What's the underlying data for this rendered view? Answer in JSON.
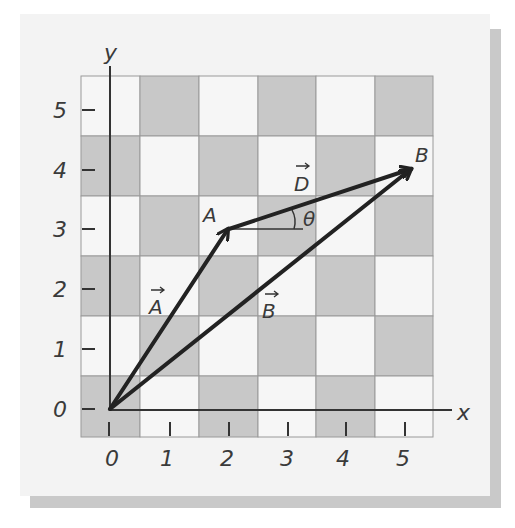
{
  "diagram": {
    "title": "",
    "axes": {
      "x_label": "x",
      "y_label": "y",
      "x_ticks": [
        "0",
        "1",
        "2",
        "3",
        "4",
        "5"
      ],
      "y_ticks": [
        "0",
        "1",
        "2",
        "3",
        "4",
        "5"
      ]
    },
    "points": {
      "A": {
        "label": "A",
        "x": 2,
        "y": 3
      },
      "B": {
        "label": "B",
        "x": 5,
        "y": 4
      }
    },
    "vectors": [
      {
        "name": "A",
        "label": "A",
        "from": [
          0,
          0
        ],
        "to": [
          2,
          3
        ]
      },
      {
        "name": "D",
        "label": "D",
        "from": [
          2,
          3
        ],
        "to": [
          5,
          4
        ]
      },
      {
        "name": "B",
        "label": "B",
        "from": [
          0,
          0
        ],
        "to": [
          5,
          4
        ]
      }
    ],
    "angle_label": "θ",
    "colors": {
      "panel": "#f3f3f3",
      "shadow": "#c9c9c9",
      "cell_dark": "#c8c8c8",
      "cell_light": "#f6f6f6",
      "grid_line": "#9a9a9a",
      "ink": "#222222"
    }
  }
}
